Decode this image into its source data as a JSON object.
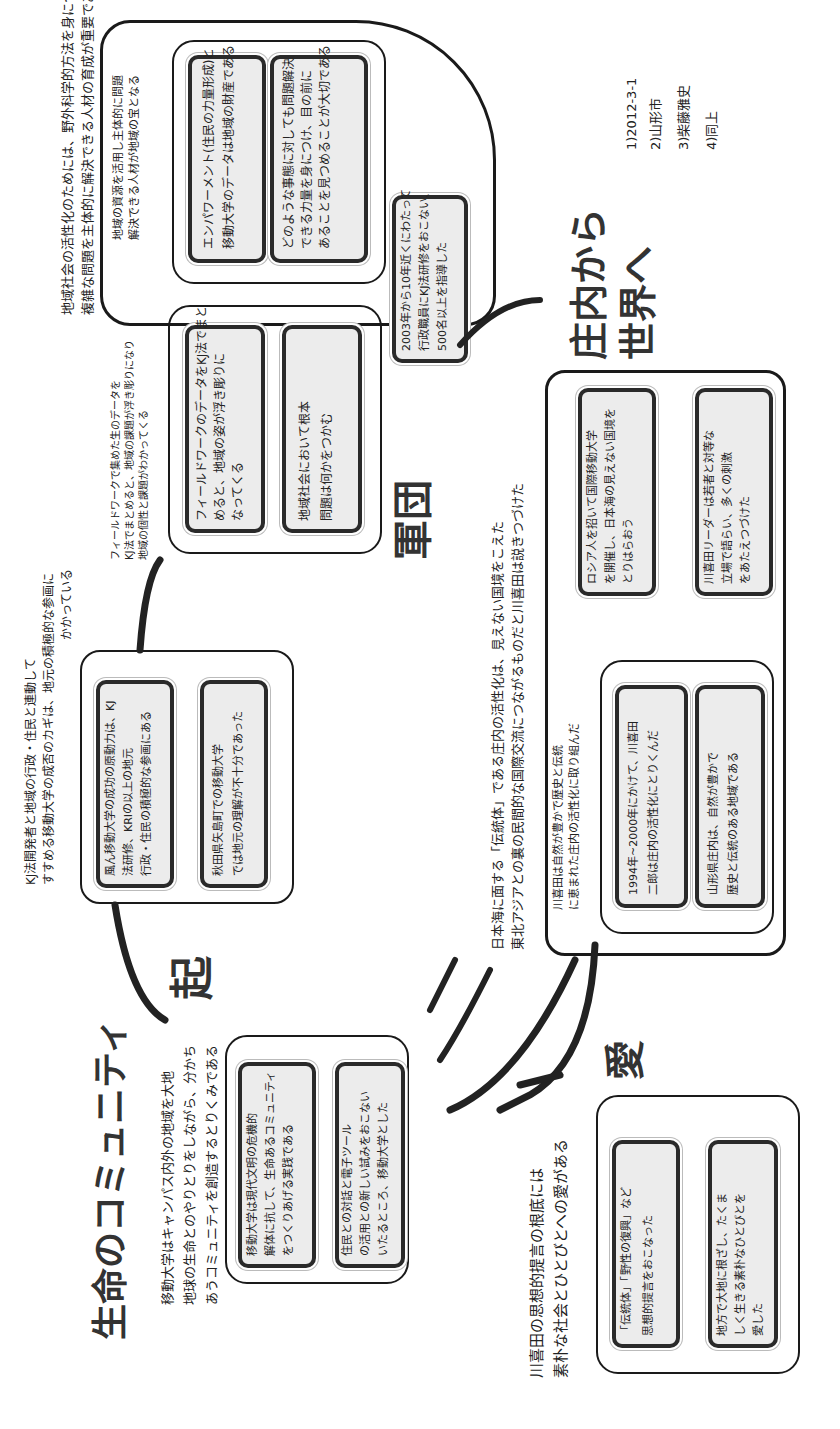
{
  "diagram": {
    "type": "kj-method-chart",
    "orientation": "rotated-90-ccw",
    "footnotes": [
      "1)2012-3-1",
      "2)山形市",
      "3)柴藤雅史",
      "4)同上"
    ],
    "stages": {
      "ki": {
        "label": "起",
        "header": [
          "KJ法開発者と地域の行政・住民と連動して",
          "すすめる移動大学の成否のカギは、地元の積極的な参画に",
          "かかっている"
        ],
        "cards": [
          [
            "風ん移動大学の成功の原動力は、KJ",
            "法研修、KRIの以上の地元",
            "行政・住民の積極的な参画にある"
          ],
          [
            "秋田県矢島町での移動大学",
            "では地元の理解が不十分であった"
          ]
        ]
      },
      "sho": {
        "label": "承",
        "label_display": "軍団",
        "header": [
          "地域社会の活性化のためには、野外科学的方法を身につけ、地域の",
          "複雑な問題を主体的に解決できる人材の育成が重要である"
        ],
        "subgroups": [
          {
            "header": [
              "地域の資源を活用し主体的に問題",
              "解決できる人材が地域の宝となる"
            ],
            "cards": [
              [
                "エンパワーメント(住民の力量形成)と",
                "移動大学のデータは地域の財産である"
              ],
              [
                "どのような事態に対しても問題解決",
                "できる力量を身につけ、目の前に",
                "あることを見つめることが大切である"
              ]
            ]
          },
          {
            "header": [
              "フィールドワークで集めた生のデータを",
              "KJ法でまとめると、地域の課題が浮き彫りになり",
              "地域の個性と課題がわかってくる"
            ],
            "cards": [
              [
                "フィールドワークのデータをKJ法でまと",
                "めると、地域の姿が浮き彫りに",
                "なってくる"
              ],
              [
                "地域社会において根本",
                "問題は何かをつかむ"
              ]
            ]
          }
        ],
        "extra_card": [
          "2003年から10年近くにわたって",
          "行政職員にKJ法研修をおこない、",
          "500名以上を指導した"
        ]
      },
      "ten": {
        "label": "庄内から世界へ",
        "header": [
          "日本海に面する「伝統体」である庄内の活性化は、見えない国境をこえた",
          "東北アジアとの裏の民間的な国際交流につながるものだと川喜田は説きつづけた"
        ],
        "subgroups": [
          {
            "header": [
              "川喜田は自然が豊かで歴史と伝統",
              "に恵まれた庄内の活性化に取り組んだ"
            ],
            "cards": [
              [
                "1994年~2000年にかけて、川喜田",
                "二郎は庄内の活性化にとりくんだ"
              ],
              [
                "山形県庄内は、自然が豊かで",
                "歴史と伝統のある地域である"
              ]
            ]
          }
        ],
        "cards": [
          [
            "ロシア人を招いて国際移動大学",
            "を開催し、日本海の見えない国境を",
            "とりはらおう"
          ],
          [
            "川喜田リーダーは若者と対等な",
            "立場で語らい、多くの刺激",
            "をあたえつづけた"
          ]
        ]
      },
      "ketsu": {
        "label": "愛",
        "header": [
          "川喜田の思想的提言の根底には",
          "素朴な社会とひとびとへの愛がある"
        ],
        "cards": [
          [
            "「伝統体」「野性の復興」など",
            "思想的提言をおこなった"
          ],
          [
            "地方で大地に根ざし、たくま",
            "しく生きる素朴なひとびとを",
            "愛した"
          ]
        ]
      },
      "seimei": {
        "label": "生命のコミュニティ",
        "header": [
          "移動大学はキャンパス内外の地域を大地",
          "地球の生命とのやりとりをしながら、分かち",
          "あうコミュニティを創造するとりくみである"
        ],
        "cards": [
          [
            "移動大学は現代文明の危機的",
            "解体に抗して、生命あるコミュニティ",
            "をつくりあげる実践である"
          ],
          [
            "住民との対話と電子ツール",
            "の活用との新しい試みをおこない",
            "いたるところ、移動大学とした"
          ]
        ]
      }
    }
  }
}
